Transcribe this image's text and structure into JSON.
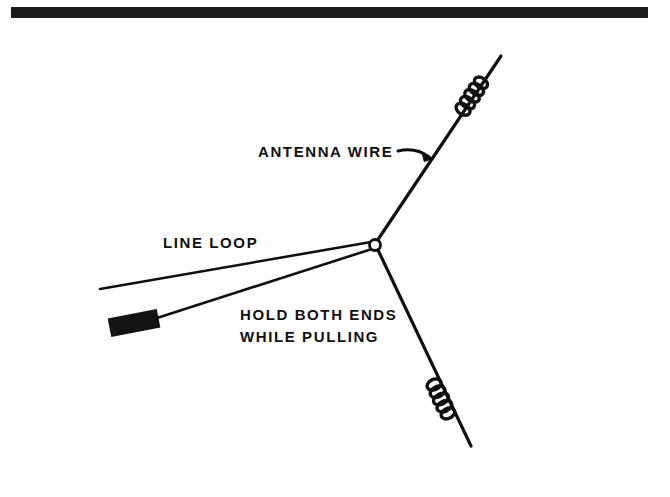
{
  "page": {
    "background_color": "#ffffff",
    "ink_color": "#101010",
    "width": 670,
    "height": 497
  },
  "top_bar": {
    "name": "horizontal-rule-bar",
    "color": "#1a1a1a",
    "x": 11,
    "y": 7,
    "width": 637,
    "height": 11
  },
  "labels": {
    "antenna_wire": "ANTENNA WIRE",
    "line_loop": "LINE LOOP",
    "hold_both_ends": "HOLD BOTH ENDS",
    "while_pulling": "WHILE PULLING"
  },
  "diagram": {
    "junction": {
      "name": "line-loop-knot",
      "cx": 375,
      "cy": 245,
      "r": 5.5
    },
    "wires": [
      {
        "name": "antenna-wire-upper-branch",
        "from_x": 377,
        "from_y": 240,
        "to_x": 501,
        "to_y": 56,
        "coil_turns": 5
      },
      {
        "name": "antenna-wire-lower-branch",
        "from_x": 378,
        "from_y": 250,
        "to_x": 471,
        "to_y": 446,
        "coil_turns": 5
      },
      {
        "name": "line-loop-free-end",
        "from_x": 370,
        "from_y": 243,
        "to_x": 100,
        "to_y": 289
      },
      {
        "name": "line-loop-weighted-end",
        "from_x": 371,
        "from_y": 249,
        "to_x": 156,
        "to_y": 318
      }
    ],
    "weight": {
      "name": "casting-weight",
      "cx": 134,
      "cy": 323,
      "length": 50,
      "thickness": 19,
      "angle_deg": -11,
      "color": "#141414"
    },
    "callout_arrow": {
      "name": "antenna-wire-callout-arrow",
      "tail_x": 398,
      "tail_y": 152,
      "tip_x": 433,
      "tip_y": 158
    }
  },
  "label_positions": {
    "antenna_wire": {
      "x": 258,
      "y": 157
    },
    "line_loop": {
      "x": 163,
      "y": 248
    },
    "hold_both_ends": {
      "x": 240,
      "y": 320
    },
    "while_pulling": {
      "x": 240,
      "y": 342
    }
  }
}
